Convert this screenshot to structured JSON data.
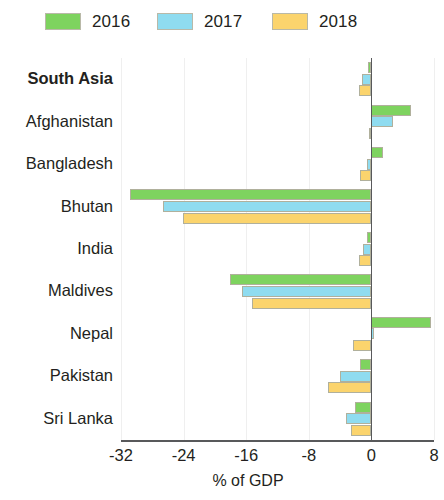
{
  "legend": {
    "items": [
      {
        "label": "2016",
        "color": "#7ED35F"
      },
      {
        "label": "2017",
        "color": "#8FDCF0"
      },
      {
        "label": "2018",
        "color": "#FBD46D"
      }
    ]
  },
  "axis": {
    "x_title": "% of GDP",
    "ticks": [
      "-32",
      "-24",
      "-16",
      "-8",
      "0",
      "8"
    ]
  },
  "chart_data": {
    "type": "bar",
    "orientation": "horizontal",
    "title": "",
    "subtitle": "",
    "xlabel": "% of GDP",
    "ylabel": "",
    "xlim": [
      -32,
      8
    ],
    "xticks": [
      -32,
      -24,
      -16,
      -8,
      0,
      8
    ],
    "grid": true,
    "legend_position": "top-left",
    "categories": [
      "South Asia",
      "Afghanistan",
      "Bangladesh",
      "Bhutan",
      "India",
      "Maldives",
      "Nepal",
      "Pakistan",
      "Sri Lanka"
    ],
    "bold_categories": [
      "South Asia"
    ],
    "series": [
      {
        "name": "2016",
        "color": "#7ED35F",
        "values": [
          -0.4,
          5.0,
          1.5,
          -30.8,
          -0.6,
          -18.1,
          7.6,
          -1.5,
          -2.1
        ]
      },
      {
        "name": "2017",
        "color": "#8FDCF0",
        "values": [
          -1.2,
          2.7,
          -0.5,
          -26.6,
          -1.1,
          -16.6,
          0.3,
          -4.0,
          -3.2
        ]
      },
      {
        "name": "2018",
        "color": "#FBD46D",
        "values": [
          -1.6,
          -0.3,
          -1.5,
          -24.1,
          -1.6,
          -15.3,
          -2.4,
          -5.5,
          -2.6
        ]
      }
    ]
  }
}
